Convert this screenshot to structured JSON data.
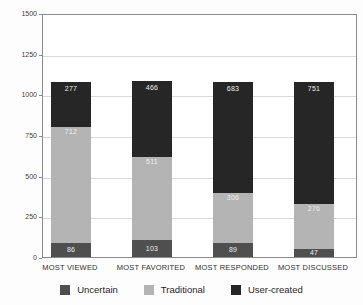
{
  "chart_data": {
    "type": "bar",
    "stacked": true,
    "title": "",
    "xlabel": "",
    "ylabel": "",
    "categories": [
      "MOST VIEWED",
      "MOST FAVORITED",
      "MOST RESPONDED",
      "MOST DISCUSSED"
    ],
    "series": [
      {
        "name": "Uncertain",
        "color": "#4f4f4f",
        "values": [
          86,
          103,
          89,
          47
        ]
      },
      {
        "name": "Traditional",
        "color": "#b4b4b4",
        "values": [
          712,
          511,
          306,
          276
        ]
      },
      {
        "name": "User-created",
        "color": "#262626",
        "values": [
          277,
          466,
          683,
          751
        ]
      }
    ],
    "ylim": [
      0,
      1500
    ],
    "yticks": [
      "0",
      "250",
      "500",
      "750",
      "1000",
      "1250",
      "1500"
    ],
    "grid": true,
    "bar_value_labels": true,
    "legend_position": "bottom"
  },
  "colors": {
    "grid": "#d9d9d9",
    "axis_border": "#8a8a8a",
    "segment_label": "#ededed",
    "tick_label": "#3d3d3d"
  }
}
